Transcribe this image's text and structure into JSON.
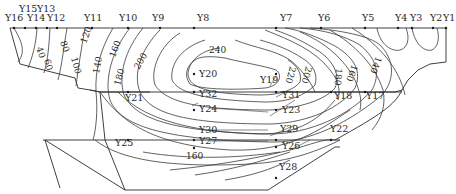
{
  "diagram": {
    "type": "contour-section",
    "top_labels": {
      "Y16": "Y16",
      "Y15": "Y15",
      "Y14": "Y14",
      "Y13": "Y13",
      "Y12": "Y12",
      "Y11": "Y11",
      "Y10": "Y10",
      "Y9": "Y9",
      "Y8": "Y8",
      "Y7": "Y7",
      "Y6": "Y6",
      "Y5": "Y5",
      "Y4": "Y4",
      "Y3": "Y3",
      "Y2": "Y2",
      "Y1": "Y1"
    },
    "interior_labels": {
      "Y20": "Y20",
      "Y19": "Y19",
      "Y21": "Y21",
      "Y32": "Y32",
      "Y31": "Y31",
      "Y18": "Y18",
      "Y17": "Y17",
      "Y24": "Y24",
      "Y23": "Y23",
      "Y30": "Y30",
      "Y29": "Y29",
      "Y22": "Y22",
      "Y25": "Y25",
      "Y27": "Y27",
      "Y26": "Y26",
      "Y28": "Y28"
    },
    "contour_labels": {
      "c40": "40",
      "c60": "60",
      "c80": "80",
      "c100": "100",
      "c120": "120",
      "c140": "140",
      "c160": "160",
      "c180": "180",
      "c200": "200",
      "c240": "240",
      "r220": "220",
      "r200": "200",
      "r180": "180",
      "r160": "160",
      "r140": "140",
      "b160": "160"
    },
    "contour_values": [
      40,
      60,
      80,
      100,
      120,
      140,
      160,
      180,
      200,
      220,
      240
    ]
  }
}
